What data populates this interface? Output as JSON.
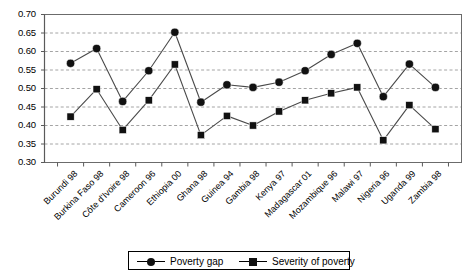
{
  "chart_data": {
    "type": "line",
    "title": "",
    "subtitle": "",
    "xlabel": "",
    "ylabel": "",
    "ylim": [
      0.3,
      0.7
    ],
    "ytick_step": 0.05,
    "ytick_labels": [
      "0.30",
      "0.35",
      "0.40",
      "0.45",
      "0.50",
      "0.55",
      "0.60",
      "0.65",
      "0.70"
    ],
    "ytick_values": [
      0.3,
      0.35,
      0.4,
      0.45,
      0.5,
      0.55,
      0.6,
      0.65,
      0.7
    ],
    "grid": "horizontal-dashed",
    "legend_position": "bottom-center",
    "categories": [
      "Burundi 98",
      "Burkina Faso 98",
      "Côte d'Ivoire 98",
      "Cameroon 96",
      "Ethiopia 00",
      "Ghana 98",
      "Guinea 94",
      "Gambia 98",
      "Kenya 97",
      "Madagascar 01",
      "Mozambique 96",
      "Malawi 97",
      "Nigeria 96",
      "Uganda 99",
      "Zambia 98"
    ],
    "series": [
      {
        "name": "Poverty gap",
        "marker": "circle",
        "color": "#111111",
        "values": [
          0.568,
          0.608,
          0.465,
          0.548,
          0.652,
          0.463,
          0.51,
          0.503,
          0.517,
          0.548,
          0.592,
          0.622,
          0.478,
          0.566,
          0.503
        ]
      },
      {
        "name": "Severity of poverty",
        "marker": "square",
        "color": "#111111",
        "values": [
          0.424,
          0.498,
          0.388,
          0.468,
          0.565,
          0.374,
          0.426,
          0.4,
          0.438,
          0.468,
          0.487,
          0.503,
          0.36,
          0.455,
          0.39
        ]
      }
    ]
  },
  "legend": {
    "items": [
      {
        "label": "Poverty gap",
        "marker": "circle"
      },
      {
        "label": "Severity of poverty",
        "marker": "square"
      }
    ]
  },
  "colors": {
    "axis": "#6b6b6b",
    "grid": "#9a9a9a",
    "marker": "#111111",
    "line": "#4a4a4a",
    "text": "#000000",
    "background": "#ffffff"
  }
}
